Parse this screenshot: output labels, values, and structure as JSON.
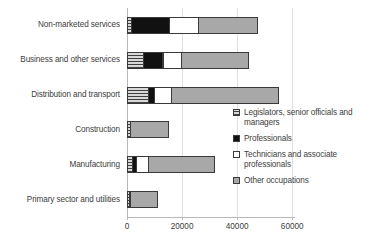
{
  "chart_data": {
    "type": "bar",
    "orientation": "horizontal",
    "stacked": true,
    "title": "",
    "xlabel": "",
    "ylabel": "",
    "xlim": [
      0,
      61000
    ],
    "grid": true,
    "legend_position": "right",
    "xticks": [
      "0",
      "20000",
      "40000",
      "60000"
    ],
    "xtick_values": [
      0,
      20000,
      40000,
      60000
    ],
    "categories": [
      "Non-marketed services",
      "Business and other services",
      "Distribution and transport",
      "Construction",
      "Manufacturing",
      "Primary sector and utilities"
    ],
    "series": [
      {
        "name": "Legislators, senior officials and managers",
        "key": "legislators",
        "values": [
          1800,
          6000,
          8000,
          1500,
          2000,
          1200
        ]
      },
      {
        "name": "Professionals",
        "key": "professionals",
        "values": [
          14000,
          7500,
          2500,
          0,
          2000,
          0
        ]
      },
      {
        "name": "Technicians and associate professionals",
        "key": "technicians",
        "values": [
          11000,
          7000,
          6500,
          0,
          4500,
          0
        ]
      },
      {
        "name": "Other occupations",
        "key": "other",
        "values": [
          21500,
          24500,
          39000,
          14000,
          24500,
          10500
        ]
      }
    ],
    "totals": [
      48300,
      45000,
      56000,
      15500,
      33000,
      11700
    ]
  },
  "legend": {
    "items": [
      {
        "label": "Legislators, senior officials and managers",
        "key": "legislators"
      },
      {
        "label": "Professionals",
        "key": "professionals"
      },
      {
        "label": "Technicians and associate professionals",
        "key": "technicians"
      },
      {
        "label": "Other occupations",
        "key": "other"
      }
    ]
  },
  "colors": {
    "legislators": "#bdbdbd",
    "professionals": "#111111",
    "technicians": "#ffffff",
    "other": "#a8a8a8",
    "outline": "#3a3a3a",
    "grid": "#e0e0e0",
    "axis": "#b8b8b8",
    "text": "#3d3d3d",
    "background": "#ffffff"
  }
}
